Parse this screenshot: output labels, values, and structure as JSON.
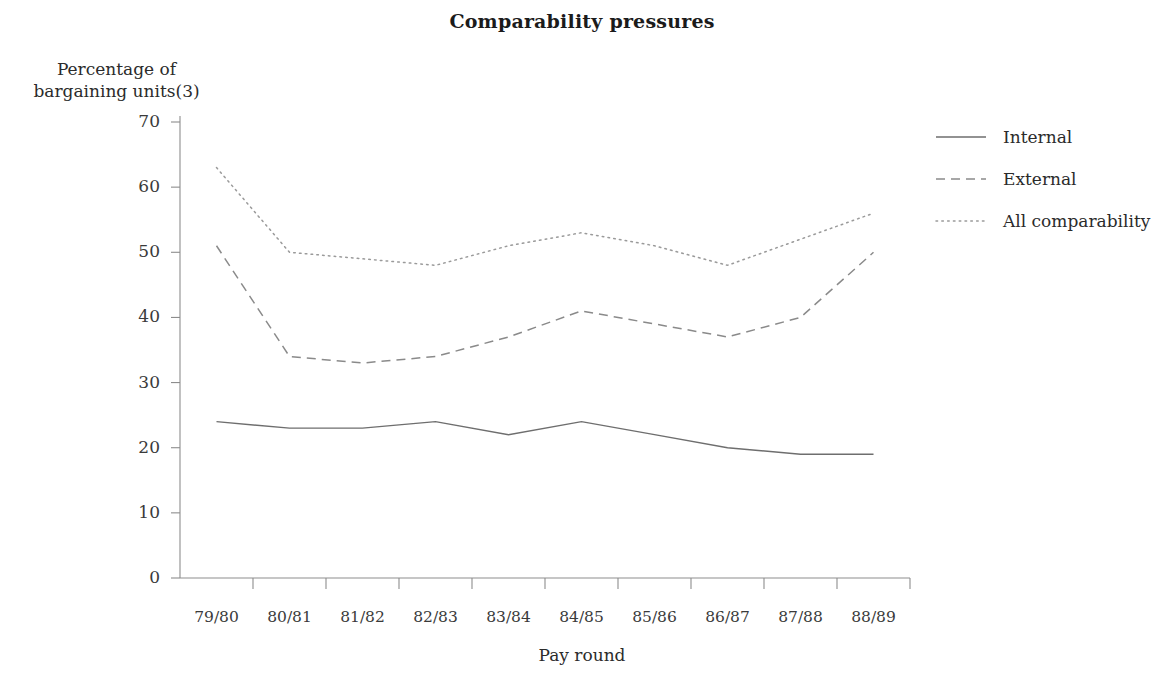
{
  "chart_data": {
    "type": "line",
    "title": "Comparability pressures",
    "xlabel": "Pay round",
    "ylabel": "Percentage of bargaining units(3)",
    "ylabel_lines": [
      "Percentage of",
      "bargaining units(3)"
    ],
    "categories": [
      "79/80",
      "80/81",
      "81/82",
      "82/83",
      "83/84",
      "84/85",
      "85/86",
      "86/87",
      "87/88",
      "88/89"
    ],
    "yticks": [
      0,
      10,
      20,
      30,
      40,
      50,
      60,
      70
    ],
    "ylim": [
      0,
      70
    ],
    "grid": false,
    "legend_position": "right",
    "series": [
      {
        "name": "Internal",
        "style": "solid",
        "color": "#6e6e6e",
        "values": [
          24,
          23,
          23,
          24,
          22,
          24,
          22,
          20,
          19,
          19
        ]
      },
      {
        "name": "External",
        "style": "dashed",
        "color": "#8a8a8a",
        "values": [
          51,
          34,
          33,
          34,
          37,
          41,
          39,
          37,
          40,
          50
        ]
      },
      {
        "name": "All comparability",
        "style": "dotted",
        "color": "#9a9a9a",
        "values": [
          63,
          50,
          49,
          48,
          51,
          53,
          51,
          48,
          52,
          56
        ]
      }
    ]
  },
  "legend": {
    "items": [
      {
        "label": "Internal"
      },
      {
        "label": "External"
      },
      {
        "label": "All comparability"
      }
    ]
  },
  "axis_color": "#8d8d8d"
}
